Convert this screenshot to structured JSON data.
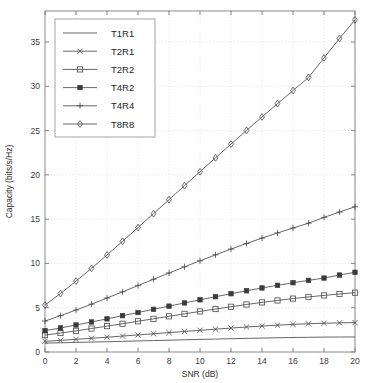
{
  "chart_data": {
    "type": "line",
    "title": "",
    "xlabel": "SNR (dB)",
    "ylabel": "Capacity (bits/s/Hz)",
    "xlim": [
      0,
      20
    ],
    "ylim": [
      0,
      38.5
    ],
    "xticks": [
      0,
      2,
      4,
      6,
      8,
      10,
      12,
      14,
      16,
      18,
      20
    ],
    "yticks": [
      0,
      5,
      10,
      15,
      20,
      25,
      30,
      35
    ],
    "xticklabels": [
      "0",
      "2",
      "4",
      "6",
      "8",
      "10",
      "12",
      "14",
      "16",
      "18",
      "20"
    ],
    "yticklabels": [
      "0",
      "5",
      "10",
      "15",
      "20",
      "25",
      "30",
      "35"
    ],
    "grid": true,
    "legend_position": "upper-left",
    "x": [
      0,
      1,
      2,
      3,
      4,
      5,
      6,
      7,
      8,
      9,
      10,
      11,
      12,
      13,
      14,
      15,
      16,
      17,
      18,
      19,
      20
    ],
    "series": [
      {
        "name": "T1R1",
        "marker": "none",
        "values": [
          1.0,
          1.04,
          1.08,
          1.12,
          1.16,
          1.2,
          1.25,
          1.29,
          1.33,
          1.38,
          1.42,
          1.46,
          1.5,
          1.54,
          1.57,
          1.61,
          1.64,
          1.66,
          1.68,
          1.69,
          1.7
        ]
      },
      {
        "name": "T2R1",
        "marker": "x",
        "values": [
          1.2,
          1.31,
          1.43,
          1.55,
          1.67,
          1.8,
          1.93,
          2.06,
          2.19,
          2.32,
          2.45,
          2.58,
          2.7,
          2.82,
          2.93,
          3.03,
          3.12,
          3.19,
          3.25,
          3.29,
          3.32
        ]
      },
      {
        "name": "T2R2",
        "marker": "square",
        "values": [
          1.9,
          2.14,
          2.39,
          2.65,
          2.92,
          3.19,
          3.47,
          3.75,
          4.03,
          4.31,
          4.58,
          4.85,
          5.11,
          5.36,
          5.6,
          5.82,
          6.03,
          6.22,
          6.39,
          6.55,
          6.7
        ]
      },
      {
        "name": "T4R2",
        "marker": "square-filled",
        "values": [
          2.4,
          2.72,
          3.05,
          3.39,
          3.74,
          4.1,
          4.46,
          4.82,
          5.18,
          5.54,
          5.89,
          6.24,
          6.58,
          6.91,
          7.23,
          7.53,
          7.82,
          8.09,
          8.35,
          8.69,
          9.0
        ]
      },
      {
        "name": "T4R4",
        "marker": "plus",
        "values": [
          3.5,
          4.1,
          4.74,
          5.4,
          6.09,
          6.79,
          7.5,
          8.21,
          8.92,
          9.62,
          10.3,
          10.97,
          11.62,
          12.25,
          12.86,
          13.44,
          14.0,
          14.54,
          15.2,
          15.8,
          16.4
        ]
      },
      {
        "name": "T8R8",
        "marker": "diamond",
        "values": [
          5.3,
          6.6,
          8.0,
          9.45,
          10.95,
          12.5,
          14.05,
          15.62,
          17.2,
          18.78,
          20.35,
          21.92,
          23.48,
          25.02,
          26.54,
          28.04,
          29.52,
          31.0,
          33.2,
          35.4,
          37.5
        ]
      }
    ]
  },
  "legend": {
    "items": [
      {
        "label": "T1R1"
      },
      {
        "label": "T2R1"
      },
      {
        "label": "T2R2"
      },
      {
        "label": "T4R2"
      },
      {
        "label": "T4R4"
      },
      {
        "label": "T8R8"
      }
    ]
  },
  "colors": {
    "curve": "#4a4a4a",
    "grid": "#d9d9d9",
    "axis": "#8a8a8a",
    "background": "#ffffff"
  }
}
